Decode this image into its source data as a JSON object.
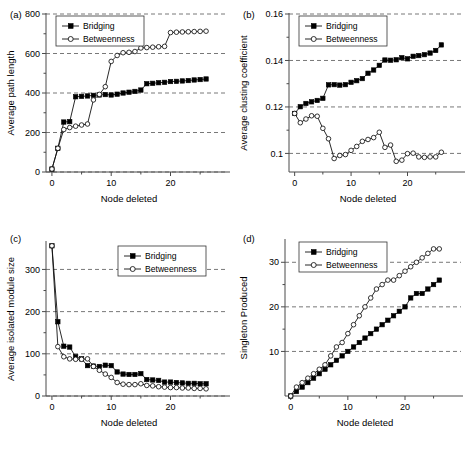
{
  "figure": {
    "panel_count": 4,
    "background": "#ffffff",
    "ink": "#000000",
    "series_names": [
      "Bridging",
      "Betweenness"
    ],
    "shared_xlabel": "Node deleted"
  },
  "chart_data": [
    {
      "id": "a",
      "type": "line",
      "panel_label": "(a)",
      "title": "",
      "xlabel": "Node deleted",
      "ylabel": "Average path length",
      "xlim": [
        -1,
        27
      ],
      "ylim": [
        0,
        800
      ],
      "xticks": [
        0,
        10,
        20
      ],
      "yticks": [
        0,
        200,
        400,
        600,
        800
      ],
      "xtick_labels": [
        "0",
        "10",
        "20"
      ],
      "ytick_labels": [
        "0",
        "200",
        "400",
        "600",
        "800"
      ],
      "grid": "horizontal-dashed",
      "legend_position": "top-left",
      "legend_entries": [
        "Bridging",
        "Betweenness"
      ],
      "x": [
        0,
        1,
        2,
        3,
        4,
        5,
        6,
        7,
        8,
        9,
        10,
        11,
        12,
        13,
        14,
        15,
        16,
        17,
        18,
        19,
        20,
        21,
        22,
        23,
        24,
        25,
        26
      ],
      "series": [
        {
          "name": "Bridging",
          "marker": "filled-square",
          "values": [
            15,
            120,
            253,
            255,
            381,
            383,
            385,
            388,
            390,
            392,
            390,
            394,
            400,
            404,
            408,
            415,
            447,
            449,
            452,
            454,
            458,
            459,
            461,
            463,
            466,
            468,
            471
          ]
        },
        {
          "name": "Betweenness",
          "marker": "open-circle",
          "values": [
            15,
            120,
            215,
            225,
            232,
            238,
            243,
            365,
            393,
            432,
            560,
            590,
            604,
            606,
            610,
            628,
            630,
            632,
            634,
            636,
            706,
            708,
            709,
            710,
            711,
            712,
            713
          ]
        }
      ]
    },
    {
      "id": "b",
      "type": "line",
      "panel_label": "(b)",
      "title": "",
      "xlabel": "Node deleted",
      "ylabel": "Average clusting coefficient",
      "xlim": [
        -1,
        27
      ],
      "ylim": [
        0.092,
        0.16
      ],
      "xticks": [
        0,
        10,
        20
      ],
      "yticks": [
        0.1,
        0.12,
        0.14,
        0.16
      ],
      "xtick_labels": [
        "0",
        "10",
        "20"
      ],
      "ytick_labels": [
        "0.1",
        "0.12",
        "0.14",
        "0.16"
      ],
      "grid": "horizontal-dashed",
      "legend_position": "top-left",
      "legend_entries": [
        "Bridging",
        "Betweenness"
      ],
      "x": [
        0,
        1,
        2,
        3,
        4,
        5,
        6,
        7,
        8,
        9,
        10,
        11,
        12,
        13,
        14,
        15,
        16,
        17,
        18,
        19,
        20,
        21,
        22,
        23,
        24,
        25,
        26
      ],
      "series": [
        {
          "name": "Bridging",
          "marker": "filled-square",
          "values": [
            0.1172,
            0.1201,
            0.1215,
            0.1222,
            0.1228,
            0.1237,
            0.1295,
            0.1296,
            0.1294,
            0.1296,
            0.1306,
            0.1313,
            0.1322,
            0.1345,
            0.1359,
            0.1379,
            0.1402,
            0.1401,
            0.1403,
            0.1412,
            0.1407,
            0.1418,
            0.1421,
            0.1425,
            0.1432,
            0.1443,
            0.1467
          ]
        },
        {
          "name": "Betweenness",
          "marker": "open-circle",
          "values": [
            0.1172,
            0.1132,
            0.1148,
            0.1162,
            0.116,
            0.1108,
            0.1063,
            0.0978,
            0.0991,
            0.0995,
            0.1013,
            0.103,
            0.1052,
            0.106,
            0.1068,
            0.1091,
            0.1026,
            0.1036,
            0.0966,
            0.0971,
            0.0999,
            0.1001,
            0.0985,
            0.0983,
            0.0985,
            0.0985,
            0.1005,
            0.1012
          ]
        }
      ]
    },
    {
      "id": "c",
      "type": "line",
      "panel_label": "(c)",
      "title": "",
      "xlabel": "Node deleted",
      "ylabel": "Average isolated module size",
      "xlim": [
        -1,
        27
      ],
      "ylim": [
        0,
        365
      ],
      "xticks": [
        0,
        10,
        20
      ],
      "yticks": [
        0,
        100,
        200,
        300
      ],
      "xtick_labels": [
        "0",
        "10",
        "20"
      ],
      "ytick_labels": [
        "0",
        "100",
        "200",
        "300"
      ],
      "grid": "horizontal-dashed",
      "legend_position": "top-right",
      "legend_entries": [
        "Bridging",
        "Betweenness"
      ],
      "x": [
        0,
        1,
        2,
        3,
        4,
        5,
        6,
        7,
        8,
        9,
        10,
        11,
        12,
        13,
        14,
        15,
        16,
        17,
        18,
        19,
        20,
        21,
        22,
        23,
        24,
        25,
        26
      ],
      "series": [
        {
          "name": "Bridging",
          "marker": "filled-square",
          "values": [
            356,
            176,
            118,
            116,
            93,
            88,
            72,
            71,
            70,
            73,
            72,
            57,
            52,
            51,
            51,
            53,
            39,
            38,
            37,
            33,
            33,
            32,
            31,
            30,
            30,
            29,
            29
          ]
        },
        {
          "name": "Betweenness",
          "marker": "open-circle",
          "values": [
            356,
            117,
            93,
            88,
            87,
            87,
            88,
            70,
            61,
            52,
            44,
            32,
            28,
            27,
            27,
            29,
            25,
            24,
            22,
            21,
            20,
            20,
            19,
            19,
            18,
            18,
            17
          ]
        }
      ]
    },
    {
      "id": "d",
      "type": "line",
      "panel_label": "(d)",
      "title": "",
      "xlabel": "Node deleted",
      "ylabel": "Singleton Produced",
      "xlim": [
        -1,
        27
      ],
      "ylim": [
        0,
        35
      ],
      "xticks": [
        0,
        10,
        20
      ],
      "yticks": [
        10,
        20,
        30
      ],
      "xtick_labels": [
        "0",
        "10",
        "20"
      ],
      "ytick_labels": [
        "10",
        "20",
        "30"
      ],
      "grid": "horizontal-dashed",
      "legend_position": "top-left",
      "legend_entries": [
        "Bridging",
        "Betweenness"
      ],
      "x": [
        0,
        1,
        2,
        3,
        4,
        5,
        6,
        7,
        8,
        9,
        10,
        11,
        12,
        13,
        14,
        15,
        16,
        17,
        18,
        19,
        20,
        21,
        22,
        23,
        24,
        25,
        26
      ],
      "series": [
        {
          "name": "Bridging",
          "marker": "filled-square",
          "values": [
            0,
            1,
            2,
            3,
            4,
            5,
            6,
            7,
            8,
            9,
            10,
            11,
            12,
            13,
            14,
            15,
            16,
            17,
            18,
            19,
            20,
            22,
            23,
            23,
            24,
            25,
            26
          ]
        },
        {
          "name": "Betweenness",
          "marker": "open-circle",
          "values": [
            0,
            2,
            3,
            4,
            5,
            6,
            7,
            9,
            11,
            12,
            14,
            16,
            18,
            20,
            22,
            24,
            25,
            26,
            26,
            27,
            28,
            29,
            30,
            31,
            32,
            33,
            33
          ]
        }
      ]
    }
  ]
}
